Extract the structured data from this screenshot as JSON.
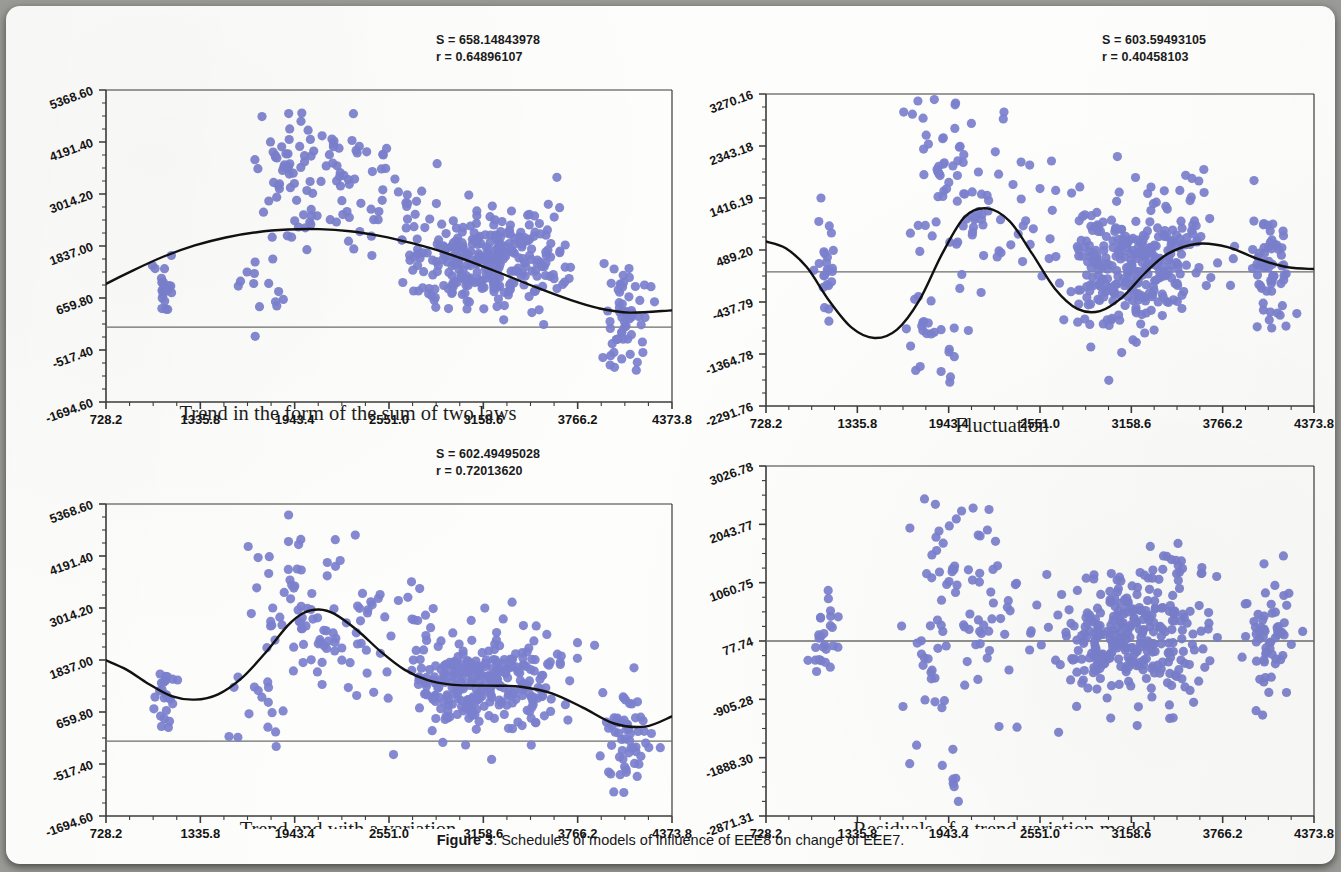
{
  "figure": {
    "caption_label": "Figure 3",
    "caption_text": ". Schedules of models of influence of EEE8 on change of EEE7.",
    "marker_color": "#7b80ce",
    "curve_color": "#111111",
    "axis_color": "#3b3b3b",
    "refline_color": "#6d6d6d"
  },
  "panels": [
    {
      "id": "trend-sum-two-laws",
      "title": "Trend in the form of the sum of two laws",
      "title_clipped": false,
      "stats": {
        "s_label": "S = 658.14843978",
        "r_label": "r = 0.64896107",
        "s_value": 658.14843978,
        "r_value": 0.64896107
      },
      "chart_data": {
        "type": "scatter",
        "title": "Trend in the form of the sum of two laws",
        "xlabel": "",
        "ylabel": "",
        "xlim": [
          728.2,
          4373.8
        ],
        "ylim": [
          -1694.6,
          5368.6
        ],
        "grid": false,
        "legend": "none",
        "xticks": [
          "728.2",
          "1335.8",
          "1943.4",
          "2551.0",
          "3158.6",
          "3766.2",
          "4373.8"
        ],
        "xtick_values": [
          728.2,
          1335.8,
          1943.4,
          2551.0,
          3158.6,
          3766.2,
          4373.8
        ],
        "yticks": [
          "5368.60",
          "4191.40",
          "3014.20",
          "1837.00",
          "659.80",
          "-517.40",
          "-1694.60"
        ],
        "ytick_values": [
          5368.6,
          4191.4,
          3014.2,
          1837.0,
          659.8,
          -517.4,
          -1694.6
        ],
        "minor_ticks_per_interval": 3,
        "reference_line_y": 0.0,
        "fit_curve": {
          "name": "trend",
          "description": "smooth sinusoidal trend, peak near x=2150, trough near x=4000",
          "points_x": [
            728,
            900,
            1100,
            1300,
            1500,
            1700,
            1900,
            2100,
            2300,
            2500,
            2700,
            2900,
            3100,
            3300,
            3500,
            3700,
            3900,
            4100,
            4373
          ],
          "points_y": [
            980,
            1280,
            1600,
            1850,
            2030,
            2150,
            2210,
            2220,
            2170,
            2060,
            1900,
            1700,
            1450,
            1180,
            900,
            640,
            430,
            330,
            380
          ]
        },
        "clusters": [
          {
            "cx": 1120,
            "cy": 950,
            "n": 22,
            "sx": 42,
            "sy": 330
          },
          {
            "cx": 1760,
            "cy": 920,
            "n": 16,
            "sx": 95,
            "sy": 520
          },
          {
            "cx": 1900,
            "cy": 3550,
            "n": 46,
            "sx": 115,
            "sy": 720
          },
          {
            "cx": 2150,
            "cy": 3350,
            "n": 40,
            "sx": 140,
            "sy": 850
          },
          {
            "cx": 2450,
            "cy": 2950,
            "n": 24,
            "sx": 160,
            "sy": 760
          },
          {
            "cx": 2720,
            "cy": 2450,
            "n": 12,
            "sx": 90,
            "sy": 640
          },
          {
            "cx": 3000,
            "cy": 1450,
            "n": 120,
            "sx": 150,
            "sy": 520
          },
          {
            "cx": 3250,
            "cy": 1500,
            "n": 130,
            "sx": 180,
            "sy": 540
          },
          {
            "cx": 3520,
            "cy": 1600,
            "n": 45,
            "sx": 110,
            "sy": 620
          },
          {
            "cx": 4080,
            "cy": 250,
            "n": 60,
            "sx": 70,
            "sy": 560
          }
        ]
      }
    },
    {
      "id": "fluctuation",
      "title": "Fluctuation",
      "title_clipped": false,
      "stats": {
        "s_label": "S = 603.59493105",
        "r_label": "r = 0.40458103",
        "s_value": 603.59493105,
        "r_value": 0.40458103
      },
      "chart_data": {
        "type": "scatter",
        "title": "Fluctuation",
        "xlabel": "",
        "ylabel": "",
        "xlim": [
          728.2,
          4373.8
        ],
        "ylim": [
          -2291.76,
          3270.16
        ],
        "grid": false,
        "legend": "none",
        "xticks": [
          "728.2",
          "1335.8",
          "1943.4",
          "2551.0",
          "3158.6",
          "3766.2",
          "4373.8"
        ],
        "xtick_values": [
          728.2,
          1335.8,
          1943.4,
          2551.0,
          3158.6,
          3766.2,
          4373.8
        ],
        "yticks": [
          "3270.16",
          "2343.18",
          "1416.19",
          "489.20",
          "-437.79",
          "-1364.78",
          "-2291.76"
        ],
        "ytick_values": [
          3270.16,
          2343.18,
          1416.19,
          489.2,
          -437.79,
          -1364.78,
          -2291.76
        ],
        "minor_ticks_per_interval": 3,
        "reference_line_y": 100.0,
        "fit_curve": {
          "name": "damped-oscillation",
          "description": "damped sine wave, amplitude decaying toward zero at right",
          "points_x": [
            728,
            860,
            1000,
            1150,
            1300,
            1450,
            1600,
            1750,
            1900,
            2050,
            2200,
            2350,
            2500,
            2650,
            2800,
            2950,
            3100,
            3250,
            3400,
            3600,
            3800,
            4000,
            4200,
            4373
          ],
          "points_y": [
            640,
            520,
            180,
            -420,
            -900,
            -1080,
            -930,
            -400,
            420,
            1080,
            1230,
            1000,
            420,
            -200,
            -560,
            -600,
            -350,
            80,
            420,
            600,
            540,
            330,
            180,
            150
          ]
        },
        "clusters": [
          {
            "cx": 1120,
            "cy": 60,
            "n": 24,
            "sx": 40,
            "sy": 440
          },
          {
            "cx": 1760,
            "cy": -860,
            "n": 14,
            "sx": 80,
            "sy": 420
          },
          {
            "cx": 1900,
            "cy": 1950,
            "n": 42,
            "sx": 110,
            "sy": 760
          },
          {
            "cx": 2150,
            "cy": 1500,
            "n": 32,
            "sx": 130,
            "sy": 900
          },
          {
            "cx": 1960,
            "cy": -1300,
            "n": 10,
            "sx": 70,
            "sy": 380
          },
          {
            "cx": 2450,
            "cy": 1000,
            "n": 20,
            "sx": 150,
            "sy": 780
          },
          {
            "cx": 3000,
            "cy": 150,
            "n": 130,
            "sx": 150,
            "sy": 560
          },
          {
            "cx": 3250,
            "cy": 300,
            "n": 140,
            "sx": 180,
            "sy": 560
          },
          {
            "cx": 3520,
            "cy": 600,
            "n": 40,
            "sx": 110,
            "sy": 700
          },
          {
            "cx": 4080,
            "cy": 150,
            "n": 62,
            "sx": 70,
            "sy": 600
          }
        ]
      }
    },
    {
      "id": "trend-with-fluctuation",
      "title": "Trend and with a variation",
      "title_clipped": true,
      "stats": {
        "s_label": "S = 602.49495028",
        "r_label": "r = 0.72013620",
        "s_value": 602.49495028,
        "r_value": 0.7201362
      },
      "chart_data": {
        "type": "scatter",
        "title": "Trend and with a variation",
        "xlabel": "",
        "ylabel": "",
        "xlim": [
          728.2,
          4373.8
        ],
        "ylim": [
          -1694.6,
          5368.6
        ],
        "grid": false,
        "legend": "none",
        "xticks": [
          "728.2",
          "1335.8",
          "1943.4",
          "2551.0",
          "3158.6",
          "3766.2",
          "4373.8"
        ],
        "xtick_values": [
          728.2,
          1335.8,
          1943.4,
          2551.0,
          3158.6,
          3766.2,
          4373.8
        ],
        "yticks": [
          "5368.60",
          "4191.40",
          "3014.20",
          "1837.00",
          "659.80",
          "-517.40",
          "-1694.60"
        ],
        "ytick_values": [
          5368.6,
          4191.4,
          3014.2,
          1837.0,
          659.8,
          -517.4,
          -1694.6
        ],
        "minor_ticks_per_interval": 3,
        "reference_line_y": 0.0,
        "fit_curve": {
          "name": "trend-plus-fluctuation",
          "description": "composite wave: dip near x=1250, tall peak near x=2100, shoulder plateau x=2900-3400, trough near x=4050",
          "points_x": [
            728,
            860,
            1000,
            1150,
            1300,
            1450,
            1600,
            1750,
            1900,
            2000,
            2100,
            2200,
            2350,
            2500,
            2650,
            2800,
            2950,
            3100,
            3250,
            3400,
            3600,
            3800,
            4000,
            4200,
            4373
          ],
          "points_y": [
            1830,
            1620,
            1300,
            1020,
            940,
            1060,
            1420,
            1980,
            2620,
            2900,
            2980,
            2880,
            2500,
            2020,
            1620,
            1380,
            1280,
            1260,
            1255,
            1230,
            1080,
            760,
            400,
            330,
            560
          ]
        },
        "clusters": [
          {
            "cx": 1120,
            "cy": 1000,
            "n": 24,
            "sx": 42,
            "sy": 400
          },
          {
            "cx": 1760,
            "cy": 900,
            "n": 16,
            "sx": 95,
            "sy": 560
          },
          {
            "cx": 1900,
            "cy": 3150,
            "n": 40,
            "sx": 110,
            "sy": 760
          },
          {
            "cx": 2150,
            "cy": 2900,
            "n": 34,
            "sx": 135,
            "sy": 880
          },
          {
            "cx": 2450,
            "cy": 2450,
            "n": 20,
            "sx": 150,
            "sy": 780
          },
          {
            "cx": 2720,
            "cy": 2900,
            "n": 12,
            "sx": 90,
            "sy": 560
          },
          {
            "cx": 3000,
            "cy": 1250,
            "n": 120,
            "sx": 150,
            "sy": 520
          },
          {
            "cx": 3250,
            "cy": 1300,
            "n": 130,
            "sx": 180,
            "sy": 540
          },
          {
            "cx": 3520,
            "cy": 1450,
            "n": 42,
            "sx": 110,
            "sy": 640
          },
          {
            "cx": 4080,
            "cy": 180,
            "n": 58,
            "sx": 70,
            "sy": 560
          }
        ]
      }
    },
    {
      "id": "residuals",
      "title": "Residuals of a trend variation model",
      "title_clipped": true,
      "stats": null,
      "chart_data": {
        "type": "scatter",
        "title": "Residuals of a trend variation model",
        "xlabel": "",
        "ylabel": "",
        "xlim": [
          728.2,
          4373.8
        ],
        "ylim": [
          -2871.31,
          3026.78
        ],
        "grid": false,
        "legend": "none",
        "xticks": [
          "728.2",
          "1335.8",
          "1943.4",
          "2551.0",
          "3158.6",
          "3766.2",
          "4373.8"
        ],
        "xtick_values": [
          728.2,
          1335.8,
          1943.4,
          2551.0,
          3158.6,
          3766.2,
          4373.8
        ],
        "yticks": [
          "3026.78",
          "2043.77",
          "1060.75",
          "77.74",
          "-905.28",
          "-1888.30",
          "-2871.31"
        ],
        "ytick_values": [
          3026.78,
          2043.77,
          1060.75,
          77.74,
          -905.28,
          -1888.3,
          -2871.31
        ],
        "minor_ticks_per_interval": 3,
        "reference_line_y": 77.74,
        "fit_curve": null,
        "clusters": [
          {
            "cx": 1120,
            "cy": 100,
            "n": 26,
            "sx": 42,
            "sy": 430
          },
          {
            "cx": 1760,
            "cy": -500,
            "n": 16,
            "sx": 90,
            "sy": 620
          },
          {
            "cx": 1900,
            "cy": 1300,
            "n": 34,
            "sx": 110,
            "sy": 880
          },
          {
            "cx": 2150,
            "cy": 600,
            "n": 30,
            "sx": 140,
            "sy": 900
          },
          {
            "cx": 1965,
            "cy": -2200,
            "n": 7,
            "sx": 45,
            "sy": 260
          },
          {
            "cx": 2450,
            "cy": 400,
            "n": 18,
            "sx": 150,
            "sy": 800
          },
          {
            "cx": 3000,
            "cy": 120,
            "n": 130,
            "sx": 150,
            "sy": 500
          },
          {
            "cx": 3250,
            "cy": 200,
            "n": 140,
            "sx": 180,
            "sy": 520
          },
          {
            "cx": 3520,
            "cy": 500,
            "n": 40,
            "sx": 110,
            "sy": 820
          },
          {
            "cx": 4080,
            "cy": 120,
            "n": 60,
            "sx": 70,
            "sy": 620
          }
        ]
      }
    }
  ]
}
